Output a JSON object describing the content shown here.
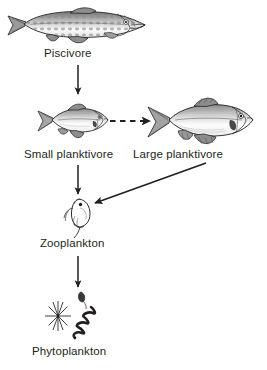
{
  "diagram": {
    "background_color": "#ffffff",
    "line_color": "#231f20",
    "text_color": "#231f20",
    "width": 267,
    "height": 370,
    "nodes": [
      {
        "id": "piscivore",
        "label": "Piscivore",
        "icon": "pike-fish-icon",
        "trophic_level": 4,
        "description": "Large elongated spotted predatory fish (pike), facing right"
      },
      {
        "id": "small_planktivore",
        "label": "Small planktivore",
        "icon": "small-cyprinid-fish-icon",
        "trophic_level": 3,
        "description": "Small deep-bodied cyprinid fish, facing right"
      },
      {
        "id": "large_planktivore",
        "label": "Large planktivore",
        "icon": "large-cyprinid-fish-icon",
        "trophic_level": 3,
        "description": "Large deep-bodied cyprinid fish, facing right"
      },
      {
        "id": "zooplankton",
        "label": "Zooplankton",
        "icon": "daphnia-water-flea-icon",
        "trophic_level": 2,
        "description": "Daphnia-like water flea with antennae and carapace"
      },
      {
        "id": "phytoplankton",
        "label": "Phytoplankton",
        "icon": "phytoplankton-cluster-icon",
        "trophic_level": 1,
        "description": "Star-shaped diatom, small flagellate and spiral cyanobacterium filament"
      }
    ],
    "edges": [
      {
        "id": "piscivore-to-small-planktivore",
        "from": "piscivore",
        "to": "small_planktivore",
        "style": "solid",
        "direction": "down",
        "arrowhead": "filled-triangle"
      },
      {
        "id": "small-to-large-planktivore",
        "from": "small_planktivore",
        "to": "large_planktivore",
        "style": "dashed",
        "direction": "right",
        "arrowhead": "filled-triangle"
      },
      {
        "id": "small-planktivore-to-zooplankton",
        "from": "small_planktivore",
        "to": "zooplankton",
        "style": "solid",
        "direction": "down",
        "arrowhead": "filled-triangle"
      },
      {
        "id": "large-planktivore-to-zooplankton",
        "from": "large_planktivore",
        "to": "zooplankton",
        "style": "solid",
        "direction": "diagonal-down-left",
        "arrowhead": "filled-triangle"
      },
      {
        "id": "zooplankton-to-phytoplankton",
        "from": "zooplankton",
        "to": "phytoplankton",
        "style": "solid",
        "direction": "down",
        "arrowhead": "filled-triangle"
      }
    ]
  }
}
